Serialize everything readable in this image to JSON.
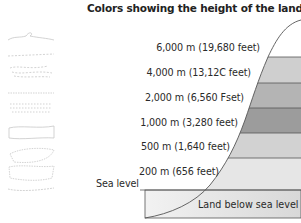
{
  "title": "Colors showing the height of the land",
  "levels": [
    {
      "label": "6,000 m (19,680 feet)",
      "color": "#ffffff"
    },
    {
      "label": "4,000 m (13,12C feet)",
      "color": "#cfcfcf"
    },
    {
      "label": "2,000 m (6,560 Fset)",
      "color": "#b3b3b3"
    },
    {
      "label": "1,000 m (3,280 feet)",
      "color": "#9a9a9a"
    },
    {
      "label": "500 m (1,640 feet)",
      "color": "#d0d0d0"
    },
    {
      "label": "200 m (656 feet)",
      "color": "#e6e6e6"
    }
  ],
  "sea_level_label": "Sea level",
  "below_sea_label": "Land below sea level",
  "below_sea_color": "#e0e0e0",
  "outline_color": "#555555"
}
